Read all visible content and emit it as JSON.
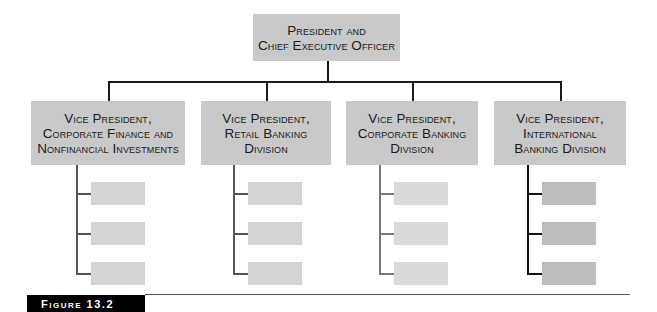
{
  "chart": {
    "root": {
      "label": "President and\nChief Executive Officer"
    },
    "divisions": [
      {
        "label": "Vice President,\nCorporate Finance and\nNonfinancial Investments",
        "sub_units": 3
      },
      {
        "label": "Vice President,\nRetail Banking\nDivision",
        "sub_units": 3
      },
      {
        "label": "Vice President,\nCorporate Banking\nDivision",
        "sub_units": 3
      },
      {
        "label": "Vice President,\nInternational\nBanking Division",
        "sub_units": 3
      }
    ]
  },
  "caption": {
    "figure_label": "Figure 13.2"
  },
  "colors": {
    "box_fill": "#c9c9c9",
    "sub_box_fill": "#d3d3d3",
    "line": "#1a1a1a",
    "figure_bar": "#000000"
  }
}
